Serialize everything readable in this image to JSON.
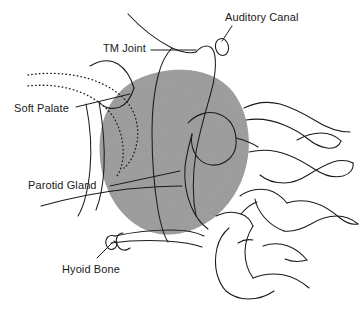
{
  "figure": {
    "type": "anatomical-line-diagram",
    "background_color": "#ffffff",
    "line_color": "#1a1a1a",
    "gland_fill_color": "#a8a8a8",
    "label_color": "#1a1a1a"
  },
  "labels": [
    {
      "id": "auditory-canal",
      "text": "Auditory Canal",
      "x": 225,
      "y": 12,
      "leader_from": [
        232,
        26
      ],
      "leader_to": [
        222,
        43
      ]
    },
    {
      "id": "tm-joint",
      "text": "TM Joint",
      "x": 103,
      "y": 43,
      "leader_from": [
        151,
        50
      ],
      "leader_to": [
        196,
        50
      ]
    },
    {
      "id": "soft-palate",
      "text": "Soft Palate",
      "x": 14,
      "y": 103,
      "leader_from": [
        76,
        107
      ],
      "leader_to": [
        128,
        95
      ]
    },
    {
      "id": "parotid-gland",
      "text": "Parotid Gland",
      "x": 28,
      "y": 180,
      "leader_from": [
        110,
        185
      ],
      "leader_to": [
        178,
        172
      ]
    },
    {
      "id": "hyoid-bone",
      "text": "Hyoid Bone",
      "x": 62,
      "y": 264,
      "leader_from": [
        97,
        258
      ],
      "leader_to": [
        112,
        243
      ]
    }
  ],
  "structures": [
    {
      "id": "parotid-gland-mass",
      "name": "Parotid gland",
      "style": "stippled gray fill"
    },
    {
      "id": "mandible-condyle",
      "name": "Mandibular condyle and ramus",
      "style": "outline"
    },
    {
      "id": "auditory-canal-oval",
      "name": "External auditory canal",
      "style": "small oval outline"
    },
    {
      "id": "soft-palate-dotted",
      "name": "Soft palate",
      "style": "dotted line"
    },
    {
      "id": "hyoid-bone-outline",
      "name": "Hyoid bone",
      "style": "outline"
    },
    {
      "id": "cervical-vertebrae",
      "name": "Cervical vertebrae",
      "count": 4,
      "style": "outline"
    }
  ]
}
